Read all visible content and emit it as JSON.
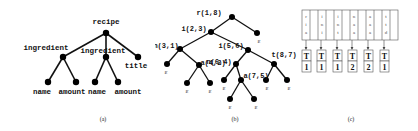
{
  "figure": {
    "panels": [
      {
        "id": "a",
        "caption": "(a)",
        "tree": {
          "root": "recipe",
          "nodes": [
            {
              "id": "recipe",
              "label": "recipe"
            },
            {
              "id": "ingredient1",
              "label": "ingredient",
              "parent": "recipe"
            },
            {
              "id": "ingredient2",
              "label": "ingredient",
              "parent": "recipe"
            },
            {
              "id": "title",
              "label": "title",
              "parent": "recipe"
            },
            {
              "id": "name1",
              "label": "name",
              "parent": "ingredient1"
            },
            {
              "id": "amount1",
              "label": "amount",
              "parent": "ingredient1"
            },
            {
              "id": "name2",
              "label": "name",
              "parent": "ingredient2"
            },
            {
              "id": "amount2",
              "label": "amount",
              "parent": "ingredient2"
            }
          ]
        }
      },
      {
        "id": "b",
        "caption": "(b)",
        "epsilon": "ε",
        "tree": {
          "nodes": [
            {
              "id": "r",
              "label": "r(1,8)"
            },
            {
              "id": "i1",
              "label": "i(2,3)",
              "parent": "r"
            },
            {
              "id": "e_r",
              "label": "ε",
              "parent": "r"
            },
            {
              "id": "n1",
              "label": "n(3,1)",
              "parent": "i1"
            },
            {
              "id": "i2",
              "label": "i(5,6)",
              "parent": "r"
            },
            {
              "id": "a1",
              "label": "a(4,2)",
              "parent": "n1"
            },
            {
              "id": "e_n1",
              "label": "ε",
              "parent": "n1"
            },
            {
              "id": "e_a1_l",
              "label": "ε",
              "parent": "a1"
            },
            {
              "id": "e_a1_r",
              "label": "ε",
              "parent": "a1"
            },
            {
              "id": "n2",
              "label": "n(6,4)",
              "parent": "i2"
            },
            {
              "id": "t",
              "label": "t(8,7)",
              "parent": "i2"
            },
            {
              "id": "e_n2",
              "label": "ε",
              "parent": "n2"
            },
            {
              "id": "a2",
              "label": "a(7,5)",
              "parent": "n2"
            },
            {
              "id": "e_a2_l",
              "label": "ε",
              "parent": "a2"
            },
            {
              "id": "e_a2_r",
              "label": "ε",
              "parent": "a2"
            },
            {
              "id": "e_t_l",
              "label": "ε",
              "parent": "t"
            },
            {
              "id": "e_t_r",
              "label": "ε",
              "parent": "t"
            }
          ]
        }
      },
      {
        "id": "c",
        "caption": "(c)",
        "columns": [
          {
            "header": [
              "r",
              "i",
              "a"
            ],
            "tag": "T",
            "count": "1"
          },
          {
            "header": [
              "i",
              "n",
              "i"
            ],
            "tag": "T",
            "count": "1"
          },
          {
            "header": [
              "i",
              "n",
              "t"
            ],
            "tag": "T",
            "count": "1"
          },
          {
            "header": [
              "n",
              "a",
              "a"
            ],
            "tag": "T",
            "count": "2"
          },
          {
            "header": [
              "a",
              "a",
              "a"
            ],
            "tag": "T",
            "count": "2"
          },
          {
            "header": [
              "t",
              "t",
              "d"
            ],
            "tag": "T",
            "count": "1"
          }
        ]
      }
    ]
  }
}
